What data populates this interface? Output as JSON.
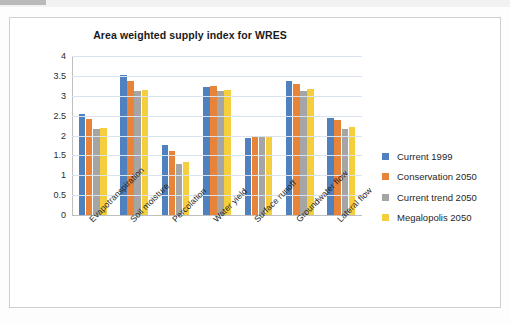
{
  "chart_data": {
    "type": "bar",
    "title": "Area weighted supply index for WRES",
    "xlabel": "",
    "ylabel": "",
    "ylim": [
      0,
      4
    ],
    "yticks": [
      "4",
      "3.5",
      "3",
      "2.5",
      "2",
      "1.5",
      "1",
      "0.5",
      "0"
    ],
    "grid": true,
    "legend_position": "right",
    "categories": [
      "Evapotranspiration",
      "Soil moisture",
      "Percolation",
      "Water yield",
      "Surface runoff",
      "Groundwater flow",
      "Lateral flow"
    ],
    "series": [
      {
        "name": "Current 1999",
        "color": "#4e81bd",
        "values": [
          2.53,
          3.53,
          1.77,
          3.21,
          1.94,
          3.37,
          2.45
        ]
      },
      {
        "name": "Conservation 2050",
        "color": "#e8833a",
        "values": [
          2.42,
          3.37,
          1.61,
          3.25,
          1.97,
          3.3,
          2.38
        ]
      },
      {
        "name": "Current trend 2050",
        "color": "#a5a5a5",
        "values": [
          2.16,
          3.11,
          1.28,
          3.11,
          1.99,
          3.11,
          2.17
        ]
      },
      {
        "name": "Megalopolis 2050",
        "color": "#f5ce3e",
        "values": [
          2.19,
          3.14,
          1.34,
          3.14,
          1.99,
          3.16,
          2.21
        ]
      }
    ]
  }
}
